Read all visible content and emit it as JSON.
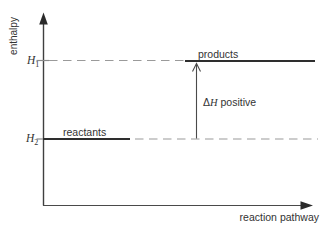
{
  "figure": {
    "y_axis": {
      "label": "enthalpy"
    },
    "x_axis": {
      "label": "reaction pathway"
    },
    "levels": {
      "h1": {
        "symbol": "H",
        "subscript": "1"
      },
      "h2": {
        "symbol": "H",
        "subscript": "2"
      },
      "products": "products",
      "reactants": "reactants"
    },
    "annotation": {
      "delta": "Δ",
      "symbol": "H",
      "text": " positive"
    },
    "colors": {
      "background": "#ffffff",
      "axis": "#3f3f3f",
      "level_line": "#2e2e2e",
      "dashed_line": "#9a9a9a",
      "text": "#333333"
    }
  }
}
